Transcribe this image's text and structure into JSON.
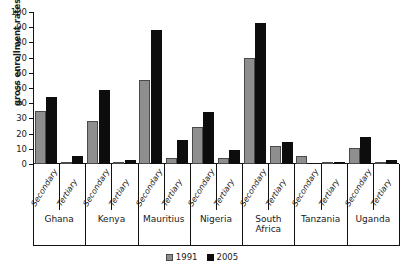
{
  "chart_data": {
    "type": "bar",
    "title": "",
    "xlabel": "",
    "ylabel": "gross enrollment rates (%)",
    "ylim": [
      0,
      100
    ],
    "ytick_step": 10,
    "grid": false,
    "legend_position": "bottom",
    "ytick_labels": [
      "100",
      "90",
      "80",
      "70",
      "60",
      "50",
      "40",
      "30",
      "20",
      "10",
      "0"
    ],
    "groups": [
      "Ghana",
      "Kenya",
      "Mauritius",
      "Nigeria",
      "South\nAfrica",
      "Tanzania",
      "Uganda"
    ],
    "subcategories": [
      "Secondary",
      "Tertiary"
    ],
    "categories": [
      "Ghana Secondary",
      "Ghana Tertiary",
      "Kenya Secondary",
      "Kenya Tertiary",
      "Mauritius Secondary",
      "Mauritius Tertiary",
      "Nigeria Secondary",
      "Nigeria Tertiary",
      "South Africa Secondary",
      "South Africa Tertiary",
      "Tanzania Secondary",
      "Tanzania Tertiary",
      "Uganda Secondary",
      "Uganda Tertiary"
    ],
    "series": [
      {
        "name": "1991",
        "color": "#8e8e8e",
        "values": [
          35,
          1,
          28,
          1.5,
          55,
          4,
          24.5,
          4,
          70,
          12,
          5,
          0.3,
          10.5,
          1.2
        ]
      },
      {
        "name": "2005",
        "color": "#0d0d0d",
        "values": [
          44,
          5,
          48.5,
          2.5,
          88,
          16,
          34,
          9.5,
          93,
          14.5,
          0,
          1,
          18,
          2.5
        ]
      }
    ]
  },
  "legend": {
    "items": [
      {
        "label": "1991",
        "color": "#8e8e8e"
      },
      {
        "label": "2005",
        "color": "#0d0d0d"
      }
    ]
  }
}
